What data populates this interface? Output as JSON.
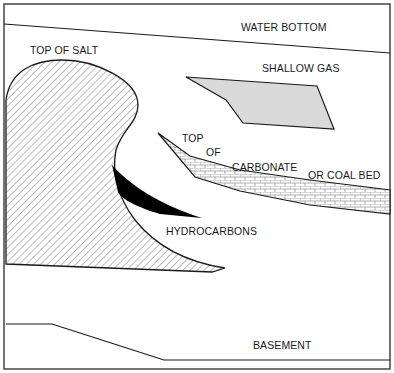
{
  "diagram": {
    "type": "geologic cross-section",
    "labels": {
      "water_bottom": "WATER BOTTOM",
      "top_of_salt": "TOP OF SALT",
      "shallow_gas": "SHALLOW GAS",
      "top": "TOP",
      "of": "OF",
      "carbonate": "CARBONATE",
      "or_coal_bed": "OR COAL BED",
      "hydrocarbons": "HYDROCARBONS",
      "basement": "BASEMENT"
    },
    "colors": {
      "line": "#1a1a1a",
      "gas_fill": "#d9d9d9",
      "hydrocarbon_fill": "#000000",
      "background": "#ffffff"
    }
  }
}
